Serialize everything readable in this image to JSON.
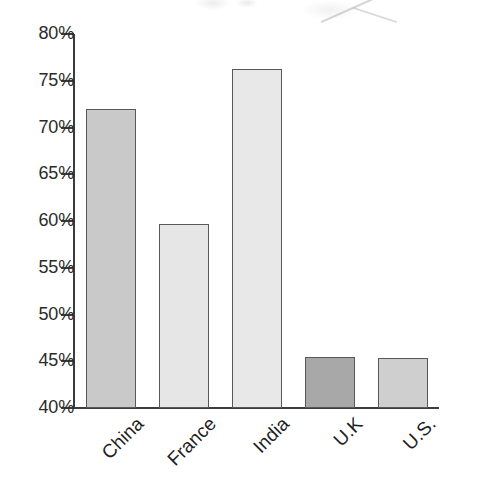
{
  "chart_data": {
    "type": "bar",
    "title": "",
    "subtitle": "",
    "xlabel": "",
    "ylabel": "",
    "categories": [
      "China",
      "France",
      "India",
      "U.K",
      "U.S."
    ],
    "values": [
      72.0,
      59.7,
      76.3,
      45.5,
      45.4
    ],
    "value_labels": [
      "",
      "",
      "",
      "",
      ""
    ],
    "bar_colors": [
      "#c9c9c9",
      "#e6e6e6",
      "#e8e8e8",
      "#a8a8a8",
      "#cfcfcf"
    ],
    "bar_border_color": "#585858",
    "ylim": [
      40,
      80
    ],
    "ytick_values": [
      80,
      75,
      70,
      65,
      60,
      55,
      50,
      45,
      40
    ],
    "ytick_labels": [
      "80%",
      "75%",
      "70%",
      "65%",
      "60%",
      "55%",
      "50%",
      "45%",
      "40%"
    ],
    "grid": false,
    "legend": false,
    "legend_position": "none",
    "axis_color": "#3c3c3c",
    "background": "#ffffff",
    "xlabel_rotation": -45
  }
}
